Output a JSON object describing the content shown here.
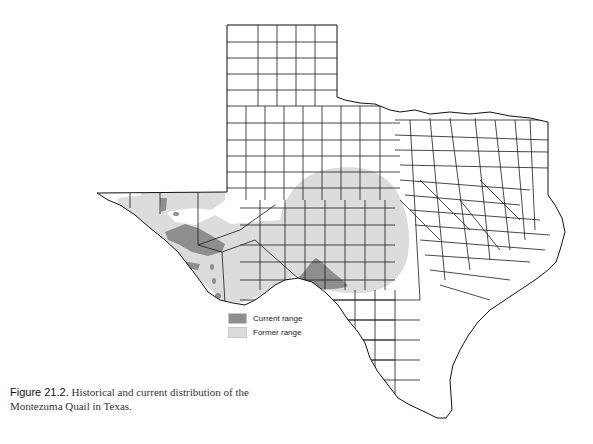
{
  "figure": {
    "label": "Figure 21.2.",
    "caption": " Historical and current distribution of the Montezuma Quail in Texas."
  },
  "legend": {
    "items": [
      {
        "label": "Current range",
        "color": "#8e8e8e"
      },
      {
        "label": "Former range",
        "color": "#dcdcdc"
      }
    ]
  },
  "map": {
    "subject": "Texas counties",
    "colors": {
      "current_range": "#8e8e8e",
      "former_range": "#dcdcdc",
      "county_lines": "#1a1a1a",
      "background": "#ffffff"
    }
  }
}
